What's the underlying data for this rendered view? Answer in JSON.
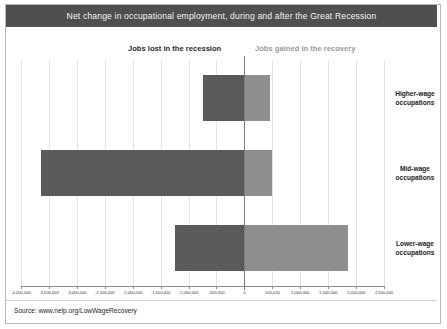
{
  "title": "Net change in occupational employment, during and after the Great Recession",
  "headers": {
    "left": "Jobs lost in the recession",
    "right": "Jobs gained in the recovery"
  },
  "source": "Source: www.nelp.org/LowWageRecovery",
  "colors": {
    "title_band": "#4f4f4f",
    "title_text": "#f2f2f2",
    "loss_bar": "#5a5a5a",
    "gain_bar": "#8f8f8f",
    "gridline": "#e4e4e4",
    "axis": "#8d8d8d"
  },
  "chart_data": {
    "type": "bar",
    "orientation": "horizontal",
    "title": "Net change in occupational employment, during and after the Great Recession",
    "xlabel": "",
    "ylabel": "",
    "xlim": [
      -4000000,
      2500000
    ],
    "grid": true,
    "legend": "none",
    "categories": [
      "Higher-wage occupations",
      "Mid-wage occupations",
      "Lower-wage occupations"
    ],
    "tick_labels": [
      "-4,000,000",
      "-3,500,000",
      "-3,000,000",
      "-2,500,000",
      "-2,000,000",
      "-1,500,000",
      "-1,000,000",
      "-500,000",
      "0",
      "500,000",
      "1,000,000",
      "1,500,000",
      "2,000,000",
      "2,500,000"
    ],
    "tick_values": [
      -4000000,
      -3500000,
      -3000000,
      -2500000,
      -2000000,
      -1500000,
      -1000000,
      -500000,
      0,
      500000,
      1000000,
      1500000,
      2000000,
      2500000
    ],
    "series": [
      {
        "name": "Jobs lost in the recession",
        "color": "#5a5a5a",
        "values": [
          -750000,
          -3650000,
          -1250000
        ]
      },
      {
        "name": "Jobs gained in the recovery",
        "color": "#8f8f8f",
        "values": [
          450000,
          500000,
          1850000
        ]
      }
    ]
  }
}
